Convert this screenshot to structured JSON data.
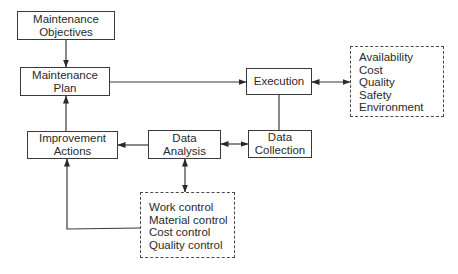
{
  "diagram": {
    "nodes": {
      "objectives": {
        "line1": "Maintenance",
        "line2": "Objectives"
      },
      "plan": {
        "line1": "Maintenance",
        "line2": "Plan"
      },
      "execution": {
        "line1": "Execution"
      },
      "improvement": {
        "line1": "Improvement",
        "line2": "Actions"
      },
      "analysis": {
        "line1": "Data",
        "line2": "Analysis"
      },
      "collection": {
        "line1": "Data",
        "line2": "Collection"
      }
    },
    "performance_box": {
      "items": [
        "Availability",
        "Cost",
        "Quality",
        "Safety",
        "Environment"
      ]
    },
    "control_box": {
      "items": [
        "Work control",
        "Material control",
        "Cost control",
        "Quality control"
      ]
    },
    "edges": [
      {
        "from": "Maintenance Objectives",
        "to": "Maintenance Plan",
        "type": "arrow"
      },
      {
        "from": "Maintenance Plan",
        "to": "Execution",
        "type": "arrow"
      },
      {
        "from": "Execution",
        "to": "Performance measures",
        "type": "bidirectional"
      },
      {
        "from": "Execution",
        "to": "Data Collection",
        "type": "line"
      },
      {
        "from": "Data Collection",
        "to": "Data Analysis",
        "type": "bidirectional"
      },
      {
        "from": "Data Analysis",
        "to": "Improvement Actions",
        "type": "arrow"
      },
      {
        "from": "Data Analysis",
        "to": "Control measures",
        "type": "bidirectional"
      },
      {
        "from": "Control measures",
        "to": "Improvement Actions",
        "type": "arrow"
      },
      {
        "from": "Improvement Actions",
        "to": "Maintenance Plan",
        "type": "arrow"
      }
    ]
  }
}
